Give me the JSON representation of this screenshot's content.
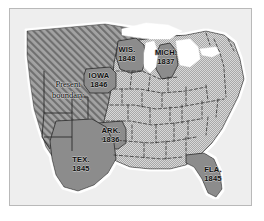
{
  "figure": {
    "kind": "historical-map",
    "region": "United States",
    "frame_border_color": "#b9b9b9",
    "ocean_color": "#eeeeee",
    "lakes_color": "#ffffff",
    "new_state_fill": "#8c8c8c",
    "existing_states_fill": "#c9c9c9",
    "territory_hatch_fill": "#9a9a9a",
    "border_line_color": "#2b2b2b"
  },
  "annotations": {
    "present_boundary": {
      "line1": "Present",
      "line2": "boundary"
    }
  },
  "states": [
    {
      "id": "wisconsin",
      "name": "WIS.",
      "year": "1848"
    },
    {
      "id": "michigan",
      "name": "MICH.",
      "year": "1837"
    },
    {
      "id": "iowa",
      "name": "IOWA",
      "year": "1846"
    },
    {
      "id": "arkansas",
      "name": "ARK.",
      "year": "1836"
    },
    {
      "id": "texas",
      "name": "TEX.",
      "year": "1845"
    },
    {
      "id": "florida",
      "name": "FLA.",
      "year": "1845"
    }
  ]
}
